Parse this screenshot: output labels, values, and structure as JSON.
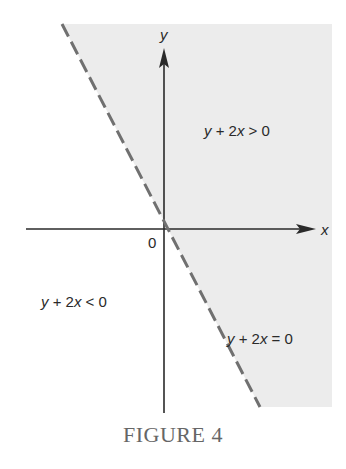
{
  "figure": {
    "caption": "FIGURE 4",
    "axes": {
      "x_label": "x",
      "y_label": "y",
      "origin_label": "0"
    },
    "regions": {
      "upper": "y + 2x > 0",
      "lower": "y + 2x < 0"
    },
    "boundary": {
      "equation": "y + 2x = 0",
      "style": "dashed"
    },
    "colors": {
      "shade": "#ececec",
      "line": "#707070",
      "axis": "#2a2a2a",
      "caption": "#666666"
    }
  },
  "labels": {
    "x": "x",
    "y": "y",
    "origin": "0",
    "upper_y": "y",
    "upper_rest": " + 2",
    "upper_x": "x",
    "upper_tail": " > 0",
    "lower_y": "y",
    "lower_rest": " + 2",
    "lower_x": "x",
    "lower_tail": " < 0",
    "eq_y": "y",
    "eq_rest": " + 2",
    "eq_x": "x",
    "eq_tail": " = 0"
  }
}
